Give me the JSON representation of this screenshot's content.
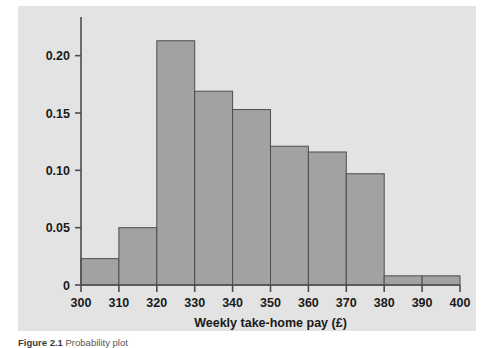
{
  "figure": {
    "background_color": "#e3e3e3",
    "page_color": "#ffffff",
    "caption_label": "Figure",
    "caption_number": "2.1",
    "caption_text": "Probability plot"
  },
  "colors": {
    "bar_fill": "#a2a2a2",
    "bar_edge": "#4d4d4d",
    "axis": "#4d4d4d",
    "tick_text": "#1a1a1a",
    "panel_background": "#e3e3e3"
  },
  "chart_data": {
    "type": "bar",
    "title": "",
    "subtitle": "",
    "xlabel": "Weekly take-home pay (£)",
    "ylabel": "",
    "grid": false,
    "legend": null,
    "histogram": true,
    "bin_width": 10,
    "xlim": [
      300,
      400
    ],
    "ylim": [
      0,
      0.225
    ],
    "xticks": [
      300,
      310,
      320,
      330,
      340,
      350,
      360,
      370,
      380,
      390,
      400
    ],
    "xticklabels": [
      "300",
      "310",
      "320",
      "330",
      "340",
      "350",
      "360",
      "370",
      "380",
      "390",
      "400"
    ],
    "yticks": [
      0,
      0.05,
      0.1,
      0.15,
      0.2
    ],
    "yticklabels": [
      "0",
      "0.05",
      "0.10",
      "0.15",
      "0.20"
    ],
    "bin_edges": [
      300,
      310,
      320,
      330,
      340,
      350,
      360,
      370,
      380,
      390,
      400
    ],
    "categories": [
      "300-310",
      "310-320",
      "320-330",
      "330-340",
      "340-350",
      "350-360",
      "360-370",
      "370-380",
      "380-390",
      "390-400"
    ],
    "values": [
      0.023,
      0.05,
      0.213,
      0.169,
      0.153,
      0.121,
      0.116,
      0.097,
      0.008,
      0.008
    ]
  }
}
